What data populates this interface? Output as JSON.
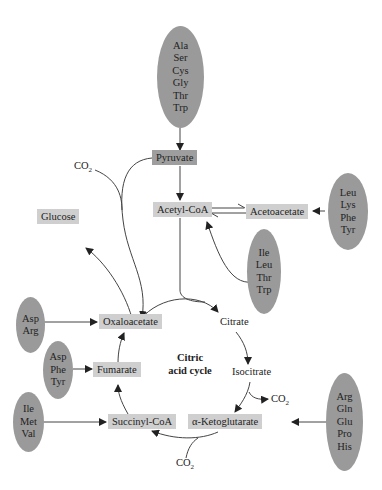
{
  "cycle_label": [
    "Citric",
    "acid cycle"
  ],
  "nodes": {
    "pyruvate": "Pyruvate",
    "acetyl_coa": "Acetyl-CoA",
    "acetoacetate": "Acetoacetate",
    "glucose": "Glucose",
    "oxaloacetate": "Oxaloacetate",
    "citrate": "Citrate",
    "isocitrate": "Isocitrate",
    "alpha_ketoglutarate": "α-Ketoglutarate",
    "succinyl_coa": "Succinyl-CoA",
    "fumarate": "Fumarate"
  },
  "co2_labels": {
    "pyruvate_co2": "CO",
    "isocitrate_co2": "CO",
    "akg_co2": "CO",
    "subscript": "2"
  },
  "amino_acid_groups": {
    "to_pyruvate": [
      "Ala",
      "Ser",
      "Cys",
      "Gly",
      "Thr",
      "Trp"
    ],
    "to_acetoacetate": [
      "Leu",
      "Lys",
      "Phe",
      "Tyr"
    ],
    "to_acetyl_coa": [
      "Ile",
      "Leu",
      "Thr",
      "Trp"
    ],
    "to_oxaloacetate": [
      "Asp",
      "Arg"
    ],
    "to_fumarate": [
      "Asp",
      "Phe",
      "Tyr"
    ],
    "to_succinyl_coa": [
      "Ile",
      "Met",
      "Val"
    ],
    "to_alpha_ketoglutarate": [
      "Arg",
      "Gln",
      "Glu",
      "Pro",
      "His"
    ]
  },
  "colors": {
    "oval_fill": "#9a9a9a",
    "box_fill": "#cfcfcf",
    "pyruvate_fill": "#9e9e9e",
    "line": "#333333"
  }
}
